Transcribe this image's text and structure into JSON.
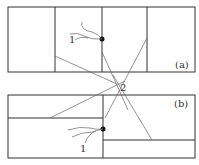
{
  "diagram": {
    "panel_a": {
      "label": "(a)",
      "point1_label": "1"
    },
    "panel_b": {
      "label": "(b)",
      "point1_label": "1"
    },
    "focus_label": "2",
    "colors": {
      "stroke": "#333333",
      "ray": "#555555",
      "dot": "#111111"
    }
  }
}
